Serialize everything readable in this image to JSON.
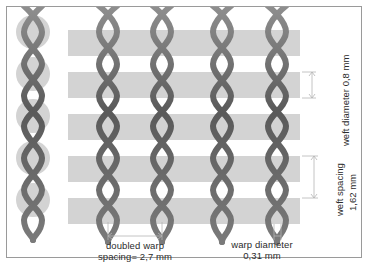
{
  "figure": {
    "frame_color": "#9a9a9a",
    "background": "#ffffff"
  },
  "mesh": {
    "wire_color": "#5e5e5e",
    "wire_highlight": "#8c8c8c",
    "weft_fill": "#d3d3d3",
    "weft_band_count": 5,
    "warp_column_count": 5,
    "doubled_warp_columns": 5,
    "weft_band_x_start": 68,
    "weft_band_x_end": 300,
    "warp_columns_x": [
      33,
      108,
      162,
      222,
      277
    ],
    "weft_bands_y": [
      30,
      72,
      114,
      156,
      198
    ],
    "weft_band_height": 26,
    "description": "Doubled warp wires cross in an X above and below each weft band; horizontal grey bands represent weft wires"
  },
  "annotations": {
    "weft_diameter": {
      "text": "weft diameter 0,8 mm",
      "orientation": "vertical",
      "value": "0,8",
      "unit": "mm"
    },
    "weft_spacing": {
      "line1": "weft spacing",
      "line2": "1,62 mm",
      "orientation": "vertical",
      "value": "1,62",
      "unit": "mm"
    },
    "doubled_warp_spacing": {
      "line1": "doubled warp",
      "line2": "spacing= 2,7 mm",
      "orientation": "horizontal",
      "value": "2,7",
      "unit": "mm"
    },
    "warp_diameter": {
      "line1": "warp diameter",
      "line2": "0,31 mm",
      "orientation": "horizontal",
      "value": "0,31",
      "unit": "mm"
    }
  }
}
